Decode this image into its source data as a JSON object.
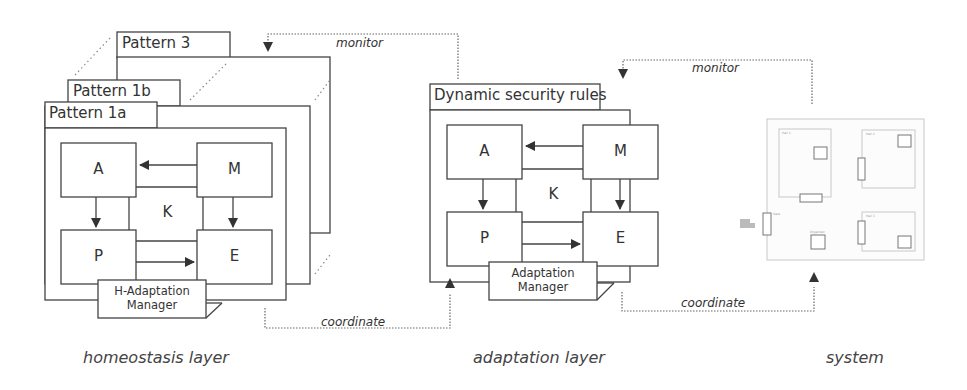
{
  "diagram": {
    "homeostasis": {
      "patterns": [
        {
          "label": "Pattern 3"
        },
        {
          "label": "Pattern 1b"
        },
        {
          "label": "Pattern 1a"
        }
      ],
      "mapek": {
        "a": "A",
        "m": "M",
        "k": "K",
        "p": "P",
        "e": "E"
      },
      "manager": {
        "line1": "H-Adaptation",
        "line2": "Manager"
      },
      "caption": "homeostasis layer"
    },
    "adaptation": {
      "title": "Dynamic security rules",
      "mapek": {
        "a": "A",
        "m": "M",
        "k": "K",
        "p": "P",
        "e": "E"
      },
      "manager": {
        "line1": "Adaptation",
        "line2": "Manager"
      },
      "caption": "adaptation layer"
    },
    "system": {
      "caption": "system",
      "rooms": [
        "Hall 1",
        "Hall 2",
        "Hall 3",
        "Gate",
        "Organizer"
      ]
    },
    "edges": {
      "monitor_left": "monitor",
      "monitor_right": "monitor",
      "coordinate_left": "coordinate",
      "coordinate_right": "coordinate"
    },
    "colors": {
      "stroke": "#444444",
      "dotted": "#666666",
      "faint": "#bbbbbb"
    }
  }
}
